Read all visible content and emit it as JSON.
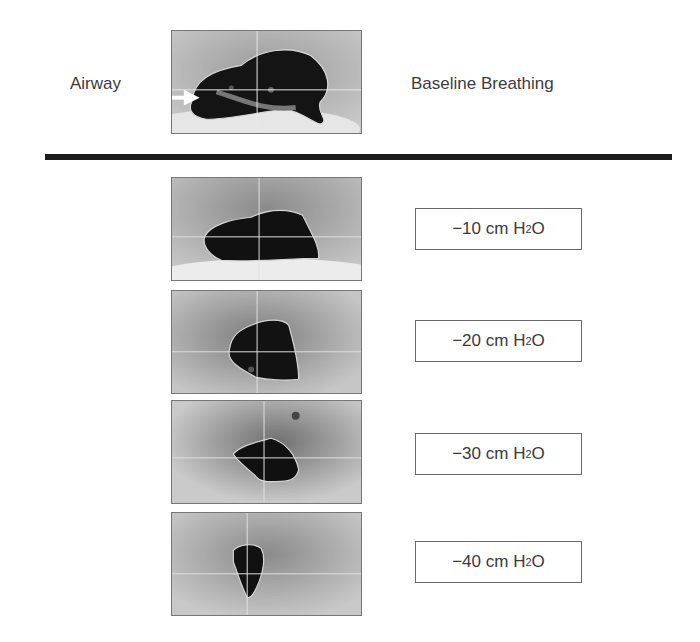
{
  "figure": {
    "row_label": "Airway",
    "baseline_label": "Baseline Breathing",
    "pressure_conditions": [
      {
        "value": "−10",
        "unit": "cm H",
        "subscript": "2",
        "suffix": "O"
      },
      {
        "value": "−20",
        "unit": "cm H",
        "subscript": "2",
        "suffix": "O"
      },
      {
        "value": "−30",
        "unit": "cm H",
        "subscript": "2",
        "suffix": "O"
      },
      {
        "value": "−40",
        "unit": "cm H",
        "subscript": "2",
        "suffix": "O"
      }
    ],
    "images": [
      {
        "name": "baseline",
        "description": "airway cross-section at baseline breathing with arrow marker"
      },
      {
        "name": "minus-10",
        "description": "airway cross-section at -10 cm H2O"
      },
      {
        "name": "minus-20",
        "description": "airway cross-section at -20 cm H2O"
      },
      {
        "name": "minus-30",
        "description": "airway cross-section at -30 cm H2O"
      },
      {
        "name": "minus-40",
        "description": "airway cross-section at -40 cm H2O"
      }
    ]
  }
}
